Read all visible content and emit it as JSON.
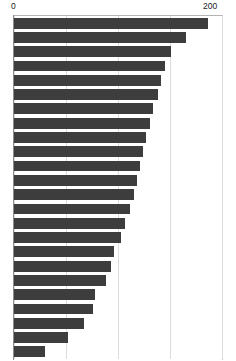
{
  "chart_data": {
    "type": "bar",
    "orientation": "horizontal",
    "title": "",
    "subtitle": "",
    "xlabel": "",
    "ylabel": "",
    "xlim": [
      0,
      200
    ],
    "grid": true,
    "grid_axis": "x",
    "legend": null,
    "bar_color": "#3d3d3d",
    "background_color": "#ffffff",
    "gridline_color": "#dcdcdc",
    "axis_color": "#8a8a8a",
    "axis_position": "top",
    "tick_labels": [
      "0",
      "200"
    ],
    "tick_values": [
      0,
      200
    ],
    "gridline_values": [
      0,
      50,
      100,
      150,
      200
    ],
    "categories": [
      "",
      "",
      "",
      "",
      "",
      "",
      "",
      "",
      "",
      "",
      "",
      "",
      "",
      "",
      "",
      "",
      "",
      "",
      "",
      "",
      "",
      "",
      "",
      ""
    ],
    "values": [
      187,
      165,
      151,
      145,
      141,
      138,
      134,
      131,
      127,
      124,
      121,
      118,
      115,
      112,
      107,
      103,
      96,
      93,
      88,
      78,
      76,
      67,
      52,
      30
    ],
    "bar_count": 24,
    "sorted": "descending"
  },
  "axis": {
    "min_label": "0",
    "max_label": "200"
  }
}
